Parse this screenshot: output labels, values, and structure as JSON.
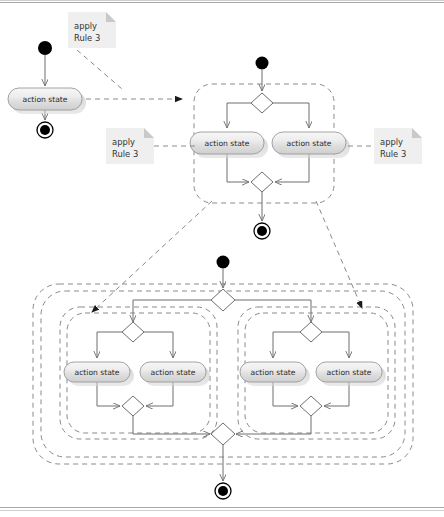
{
  "diagram": {
    "action_label": "action state",
    "note_text_line1": "apply",
    "note_text_line2": "Rule 3",
    "colors": {
      "action_fill_light": "#f4f4f4",
      "action_fill_mid": "#d8d8d8",
      "action_stroke": "#9a9a9a",
      "line": "#6e6e6e",
      "dashed": "#8a8a8a",
      "note_bg": "#efefef",
      "note_fold": "#c9c9c9",
      "node_black": "#000000"
    },
    "notes": [
      {
        "id": "note-top-left",
        "line1": "apply",
        "line2": "Rule 3",
        "x": 68,
        "y": 12,
        "w": 48,
        "h": 36
      },
      {
        "id": "note-middle",
        "line1": "apply",
        "line2": "Rule 3",
        "x": 106,
        "y": 128,
        "w": 48,
        "h": 36
      },
      {
        "id": "note-right",
        "line1": "apply",
        "line2": "Rule 3",
        "x": 374,
        "y": 128,
        "w": 48,
        "h": 36
      }
    ],
    "action_states": [
      {
        "id": "action-a",
        "label": "action state",
        "x": 8,
        "y": 88,
        "w": 74,
        "h": 22
      },
      {
        "id": "action-b1",
        "label": "action state",
        "x": 190,
        "y": 132,
        "w": 74,
        "h": 22
      },
      {
        "id": "action-b2",
        "label": "action state",
        "x": 272,
        "y": 132,
        "w": 74,
        "h": 22
      },
      {
        "id": "action-c1",
        "label": "action state",
        "x": 64,
        "y": 362,
        "w": 66,
        "h": 20
      },
      {
        "id": "action-c2",
        "label": "action state",
        "x": 140,
        "y": 362,
        "w": 66,
        "h": 20
      },
      {
        "id": "action-c3",
        "label": "action state",
        "x": 240,
        "y": 362,
        "w": 66,
        "h": 20
      },
      {
        "id": "action-c4",
        "label": "action state",
        "x": 316,
        "y": 362,
        "w": 66,
        "h": 20
      }
    ],
    "initial_nodes": [
      {
        "id": "initial-1",
        "cx": 45,
        "cy": 48,
        "r": 7
      },
      {
        "id": "initial-2",
        "cx": 262,
        "cy": 63,
        "r": 6.5
      },
      {
        "id": "initial-3",
        "cx": 223,
        "cy": 262,
        "r": 6.5
      }
    ],
    "final_nodes": [
      {
        "id": "final-1",
        "cx": 45,
        "cy": 130,
        "r_outer": 8,
        "r_inner": 5
      },
      {
        "id": "final-2",
        "cx": 262,
        "cy": 231,
        "r_outer": 8,
        "r_inner": 5
      },
      {
        "id": "final-3",
        "cx": 223,
        "cy": 491,
        "r_outer": 8,
        "r_inner": 5
      }
    ],
    "decisions": [
      {
        "id": "fork-top",
        "cx": 262,
        "cy": 103,
        "rx": 11,
        "ry": 10
      },
      {
        "id": "merge-top",
        "cx": 262,
        "cy": 182,
        "rx": 11,
        "ry": 10
      },
      {
        "id": "fork-main-bottom",
        "cx": 223,
        "cy": 300,
        "rx": 12,
        "ry": 11
      },
      {
        "id": "fork-left-bottom",
        "cx": 133,
        "cy": 332,
        "rx": 11,
        "ry": 10
      },
      {
        "id": "merge-left-bottom",
        "cx": 133,
        "cy": 406,
        "rx": 11,
        "ry": 10
      },
      {
        "id": "fork-right-bottom",
        "cx": 311,
        "cy": 332,
        "rx": 11,
        "ry": 10
      },
      {
        "id": "merge-right-bottom",
        "cx": 311,
        "cy": 406,
        "rx": 11,
        "ry": 10
      },
      {
        "id": "merge-main-bottom",
        "cx": 223,
        "cy": 434,
        "rx": 12,
        "ry": 11
      }
    ],
    "regions": [
      {
        "id": "region-top-composite",
        "x": 194,
        "y": 84,
        "w": 140,
        "h": 119,
        "rx": 18
      },
      {
        "id": "region-bottom-outer",
        "x": 33,
        "y": 284,
        "w": 380,
        "h": 180,
        "rx": 26
      },
      {
        "id": "region-bottom-outer-inner",
        "x": 41,
        "y": 291,
        "w": 364,
        "h": 166,
        "rx": 24
      },
      {
        "id": "region-bottom-left-outer",
        "x": 60,
        "y": 307,
        "w": 157,
        "h": 132,
        "rx": 20
      },
      {
        "id": "region-bottom-left-inner",
        "x": 67,
        "y": 313,
        "w": 143,
        "h": 120,
        "rx": 18
      },
      {
        "id": "region-bottom-right-outer",
        "x": 238,
        "y": 307,
        "w": 157,
        "h": 132,
        "rx": 20
      },
      {
        "id": "region-bottom-right-inner",
        "x": 245,
        "y": 313,
        "w": 143,
        "h": 120,
        "rx": 18
      }
    ],
    "rule_arrows": [
      {
        "id": "rule-arrow-1",
        "from": "action-a",
        "to": "region-top-composite"
      },
      {
        "id": "rule-arrow-2",
        "from": "region-top-composite",
        "to": "region-bottom-left-outer"
      },
      {
        "id": "rule-arrow-3",
        "from": "region-top-composite",
        "to": "region-bottom-right-outer"
      }
    ]
  }
}
